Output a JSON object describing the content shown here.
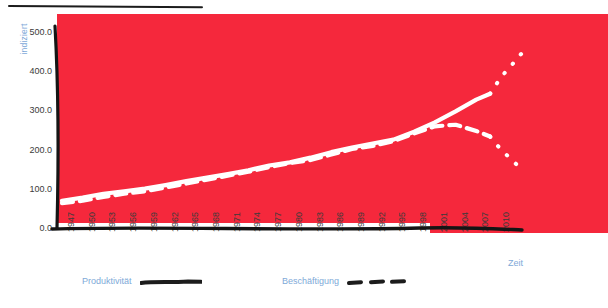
{
  "chart_data": {
    "type": "line",
    "title": "",
    "xlabel": "Zeit",
    "ylabel": "indiziert",
    "xlim": [
      1947,
      2014
    ],
    "ylim": [
      0.0,
      550.0
    ],
    "grid": false,
    "legend_position": "bottom",
    "background_color": "#f5283c",
    "line_color": "#ffffff",
    "axis_label_color": "#7ea9d8",
    "tick_label_color": "#3b3b3b",
    "ytick_labels": [
      "500.0",
      "400.0",
      "300.0",
      "200.0",
      "100.0",
      "0.0"
    ],
    "ytick_values": [
      500.0,
      400.0,
      300.0,
      200.0,
      100.0,
      0.0
    ],
    "xtick_labels": [
      "1947",
      "1950",
      "1953",
      "1956",
      "1959",
      "1962",
      "1965",
      "1968",
      "1971",
      "1974",
      "1977",
      "1980",
      "1983",
      "1986",
      "1989",
      "1992",
      "1995",
      "1998",
      "2001",
      "2004",
      "2007",
      "2010"
    ],
    "xtick_values": [
      1947,
      1950,
      1953,
      1956,
      1959,
      1962,
      1965,
      1968,
      1971,
      1974,
      1977,
      1980,
      1983,
      1986,
      1989,
      1992,
      1995,
      1998,
      2001,
      2004,
      2007,
      2010
    ],
    "series": [
      {
        "name": "Produktivität",
        "style": "solid",
        "color": "#ffffff",
        "x": [
          1947,
          1950,
          1953,
          1956,
          1959,
          1962,
          1965,
          1968,
          1971,
          1974,
          1977,
          1980,
          1983,
          1986,
          1989,
          1992,
          1995,
          1998,
          2001,
          2004,
          2007,
          2009
        ],
        "values": [
          72,
          80,
          90,
          96,
          103,
          112,
          122,
          131,
          140,
          150,
          162,
          170,
          182,
          196,
          208,
          218,
          228,
          248,
          272,
          300,
          330,
          345
        ]
      },
      {
        "name": "Produktivität (Prognose)",
        "style": "dotted",
        "color": "#ffffff",
        "x": [
          2009,
          2010,
          2011,
          2012,
          2013,
          2014
        ],
        "values": [
          345,
          372,
          396,
          415,
          438,
          455
        ]
      },
      {
        "name": "Beschäftigung",
        "style": "dashed",
        "color": "#ffffff",
        "x": [
          1947,
          1950,
          1953,
          1956,
          1959,
          1962,
          1965,
          1968,
          1971,
          1974,
          1977,
          1980,
          1983,
          1986,
          1989,
          1992,
          1995,
          1998,
          2001,
          2004,
          2007,
          2009
        ],
        "values": [
          66,
          72,
          82,
          90,
          96,
          106,
          116,
          126,
          136,
          146,
          158,
          168,
          176,
          190,
          204,
          212,
          224,
          244,
          262,
          266,
          250,
          236
        ]
      },
      {
        "name": "Beschäftigung (Prognose)",
        "style": "dotted",
        "color": "#ffffff",
        "x": [
          2009,
          2010,
          2011,
          2012,
          2013,
          2014
        ],
        "values": [
          236,
          214,
          196,
          178,
          162,
          150
        ]
      }
    ]
  },
  "legend": {
    "entries": [
      {
        "label": "Produktivität",
        "style": "solid",
        "swatch_color": "#1c1c1c"
      },
      {
        "label": "Beschäftigung",
        "style": "dashed",
        "swatch_color": "#1c1c1c"
      }
    ]
  },
  "axes": {
    "y_title": "indiziert",
    "x_title": "Zeit"
  }
}
